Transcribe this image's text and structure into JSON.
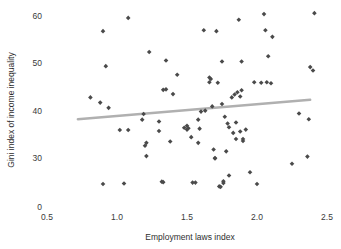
{
  "chart_data": {
    "type": "scatter",
    "title": "",
    "xlabel": "Employment laws index",
    "ylabel": "Gini index of income inequality",
    "xlim": [
      0.5,
      2.5
    ],
    "ylim": [
      0,
      62
    ],
    "xticks": [
      0.5,
      1.0,
      1.5,
      2.0,
      2.5
    ],
    "xtick_labels": [
      "0.5",
      "1.0",
      "1.5",
      "2.0",
      "2.5"
    ],
    "yticks": [
      0,
      30,
      40,
      50,
      60
    ],
    "ytick_labels": [
      "0",
      "30",
      "40",
      "50",
      "60"
    ],
    "grid": false,
    "legend": false,
    "marker_color": "#4a4a4a",
    "marker_symbol": "diamond",
    "trendline": {
      "present": true,
      "color": "#b0b0b0",
      "x_start": 0.72,
      "y_start": 38.2,
      "x_end": 2.38,
      "y_end": 42.3
    },
    "points": [
      {
        "x": 0.81,
        "y": 42.8
      },
      {
        "x": 0.88,
        "y": 41.7
      },
      {
        "x": 0.9,
        "y": 56.8
      },
      {
        "x": 0.9,
        "y": 24.5
      },
      {
        "x": 0.92,
        "y": 49.4
      },
      {
        "x": 0.94,
        "y": 40.6
      },
      {
        "x": 1.02,
        "y": 35.9
      },
      {
        "x": 1.05,
        "y": 24.6
      },
      {
        "x": 1.08,
        "y": 35.9
      },
      {
        "x": 1.08,
        "y": 59.6
      },
      {
        "x": 1.18,
        "y": 38.1
      },
      {
        "x": 1.19,
        "y": 39.3
      },
      {
        "x": 1.2,
        "y": 32.6
      },
      {
        "x": 1.21,
        "y": 33.2
      },
      {
        "x": 1.21,
        "y": 30.4
      },
      {
        "x": 1.23,
        "y": 52.4
      },
      {
        "x": 1.3,
        "y": 37.7
      },
      {
        "x": 1.3,
        "y": 35.7
      },
      {
        "x": 1.32,
        "y": 25.0
      },
      {
        "x": 1.33,
        "y": 24.9
      },
      {
        "x": 1.33,
        "y": 44.4
      },
      {
        "x": 1.35,
        "y": 44.5
      },
      {
        "x": 1.35,
        "y": 50.6
      },
      {
        "x": 1.38,
        "y": 33.5
      },
      {
        "x": 1.4,
        "y": 43.5
      },
      {
        "x": 1.43,
        "y": 47.6
      },
      {
        "x": 1.48,
        "y": 36.4
      },
      {
        "x": 1.5,
        "y": 36.0
      },
      {
        "x": 1.5,
        "y": 36.8
      },
      {
        "x": 1.51,
        "y": 36.3
      },
      {
        "x": 1.53,
        "y": 34.4
      },
      {
        "x": 1.54,
        "y": 24.8
      },
      {
        "x": 1.56,
        "y": 24.8
      },
      {
        "x": 1.58,
        "y": 33.2
      },
      {
        "x": 1.58,
        "y": 38.1
      },
      {
        "x": 1.59,
        "y": 36.2
      },
      {
        "x": 1.6,
        "y": 39.8
      },
      {
        "x": 1.62,
        "y": 57.0
      },
      {
        "x": 1.63,
        "y": 40.0
      },
      {
        "x": 1.66,
        "y": 46.0
      },
      {
        "x": 1.66,
        "y": 47.0
      },
      {
        "x": 1.67,
        "y": 46.7
      },
      {
        "x": 1.68,
        "y": 40.9
      },
      {
        "x": 1.69,
        "y": 31.8
      },
      {
        "x": 1.7,
        "y": 30.0
      },
      {
        "x": 1.7,
        "y": 29.9
      },
      {
        "x": 1.71,
        "y": 56.8
      },
      {
        "x": 1.72,
        "y": 45.9
      },
      {
        "x": 1.73,
        "y": 24.0
      },
      {
        "x": 1.74,
        "y": 23.9
      },
      {
        "x": 1.75,
        "y": 41.4
      },
      {
        "x": 1.75,
        "y": 50.4
      },
      {
        "x": 1.76,
        "y": 24.7
      },
      {
        "x": 1.76,
        "y": 25.1
      },
      {
        "x": 1.77,
        "y": 38.7
      },
      {
        "x": 1.78,
        "y": 31.4
      },
      {
        "x": 1.79,
        "y": 37.3
      },
      {
        "x": 1.8,
        "y": 36.5
      },
      {
        "x": 1.8,
        "y": 26.3
      },
      {
        "x": 1.82,
        "y": 42.8
      },
      {
        "x": 1.83,
        "y": 35.3
      },
      {
        "x": 1.84,
        "y": 43.4
      },
      {
        "x": 1.85,
        "y": 34.0
      },
      {
        "x": 1.85,
        "y": 37.5
      },
      {
        "x": 1.86,
        "y": 43.9
      },
      {
        "x": 1.87,
        "y": 59.2
      },
      {
        "x": 1.88,
        "y": 43.0
      },
      {
        "x": 1.88,
        "y": 35.6
      },
      {
        "x": 1.89,
        "y": 50.4
      },
      {
        "x": 1.89,
        "y": 44.3
      },
      {
        "x": 1.9,
        "y": 33.6
      },
      {
        "x": 1.9,
        "y": 34.0
      },
      {
        "x": 1.92,
        "y": 36.0
      },
      {
        "x": 1.95,
        "y": 27.0
      },
      {
        "x": 1.98,
        "y": 46.0
      },
      {
        "x": 2.0,
        "y": 24.5
      },
      {
        "x": 2.03,
        "y": 45.9
      },
      {
        "x": 2.05,
        "y": 60.4
      },
      {
        "x": 2.06,
        "y": 57.0
      },
      {
        "x": 2.07,
        "y": 46.0
      },
      {
        "x": 2.08,
        "y": 51.5
      },
      {
        "x": 2.1,
        "y": 45.8
      },
      {
        "x": 2.11,
        "y": 55.6
      },
      {
        "x": 2.25,
        "y": 28.8
      },
      {
        "x": 2.3,
        "y": 39.4
      },
      {
        "x": 2.36,
        "y": 30.3
      },
      {
        "x": 2.37,
        "y": 38.2
      },
      {
        "x": 2.38,
        "y": 49.2
      },
      {
        "x": 2.4,
        "y": 48.5
      },
      {
        "x": 2.41,
        "y": 60.6
      }
    ]
  }
}
